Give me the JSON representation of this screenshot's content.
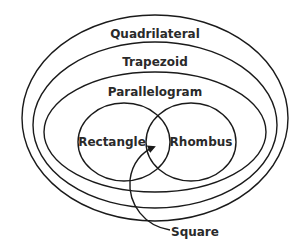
{
  "diagram": {
    "sets": [
      {
        "id": "quadrilateral",
        "label": "Quadrilateral"
      },
      {
        "id": "trapezoid",
        "label": "Trapezoid"
      },
      {
        "id": "parallelogram",
        "label": "Parallelogram"
      },
      {
        "id": "rectangle",
        "label": "Rectangle"
      },
      {
        "id": "rhombus",
        "label": "Rhombus"
      }
    ],
    "intersection_label": "Square",
    "colors": {
      "stroke": "#1a1a1a",
      "text": "#2a2a2a",
      "background": "#ffffff"
    }
  }
}
